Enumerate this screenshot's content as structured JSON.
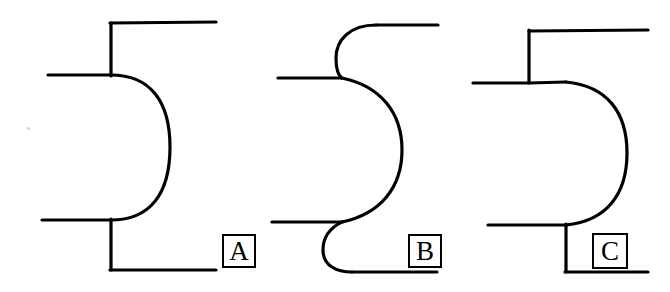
{
  "figure": {
    "background_color": "#ffffff",
    "stroke_color": "#000000",
    "width": 670,
    "height": 292,
    "caption_labels": [
      "A",
      "B",
      "C"
    ],
    "panels": [
      {
        "id": "A",
        "label": "A",
        "description": "Semicircular D-shaped bend with square corners on upper and lower leads",
        "label_box": {
          "x": 222,
          "y": 234,
          "w": 34,
          "h": 34
        },
        "stroke_width": 3.2,
        "paths": [
          {
            "name": "upper-left-lead",
            "d": "M 48 75 L 111 75"
          },
          {
            "name": "upper-vertical-riser",
            "d": "M 111 76 L 111 23"
          },
          {
            "name": "upper-top-lead",
            "d": "M 110 23 L 216 22"
          },
          {
            "name": "semicircular-arc",
            "d": "M 111 75 C 150 75 170 101 170 147 C 170 194 150 220 111 220"
          },
          {
            "name": "lower-left-lead",
            "d": "M 42 220 L 111 220"
          },
          {
            "name": "lower-vertical-drop",
            "d": "M 111 219 L 111 270"
          },
          {
            "name": "lower-bottom-lead",
            "d": "M 110 270 L 216 270"
          }
        ]
      },
      {
        "id": "B",
        "label": "B",
        "description": "Smooth S-curve bend with tangent-continuous transitions into leads",
        "label_box": {
          "x": 408,
          "y": 234,
          "w": 34,
          "h": 34
        },
        "stroke_width": 3.2,
        "paths": [
          {
            "name": "upper-top-lead",
            "d": "M 438 25 L 376 25"
          },
          {
            "name": "upper-s-transition",
            "d": "M 376 25 C 350 25 336 40 336 58 C 336 70 339 76 342 78"
          },
          {
            "name": "upper-left-lead",
            "d": "M 278 78 L 342 78"
          },
          {
            "name": "main-arc",
            "d": "M 342 78 C 380 86 402 112 402 150 C 402 188 380 214 342 222"
          },
          {
            "name": "lower-left-lead",
            "d": "M 272 222 L 342 222"
          },
          {
            "name": "lower-s-transition",
            "d": "M 342 222 C 338 224 323 231 323 250 C 323 266 337 272 352 272"
          },
          {
            "name": "lower-bottom-lead",
            "d": "M 352 272 L 437 272"
          }
        ]
      },
      {
        "id": "C",
        "label": "C",
        "description": "Flat-topped D-shaped bend, larger radius, square corners at leads",
        "label_box": {
          "x": 592,
          "y": 233,
          "w": 36,
          "h": 36
        },
        "stroke_width": 3.2,
        "paths": [
          {
            "name": "upper-top-lead",
            "d": "M 529 31 L 648 30"
          },
          {
            "name": "upper-vertical-riser",
            "d": "M 529 30 L 529 82"
          },
          {
            "name": "upper-left-lead",
            "d": "M 473 83 L 529 83"
          },
          {
            "name": "upper-shoulder-lead",
            "d": "M 529 83 L 566 82"
          },
          {
            "name": "large-arc",
            "d": "M 566 82 C 607 86 627 112 627 153 C 627 195 606 221 566 225"
          },
          {
            "name": "lower-left-lead",
            "d": "M 488 225 L 566 225"
          },
          {
            "name": "lower-vertical-drop",
            "d": "M 566 224 L 566 272"
          },
          {
            "name": "lower-bottom-lead",
            "d": "M 565 272 L 648 272"
          }
        ]
      }
    ],
    "artifacts": [
      {
        "name": "scan-speck",
        "x": 27,
        "y": 127,
        "w": 3,
        "h": 3,
        "color": "#d8d8d8"
      }
    ]
  }
}
